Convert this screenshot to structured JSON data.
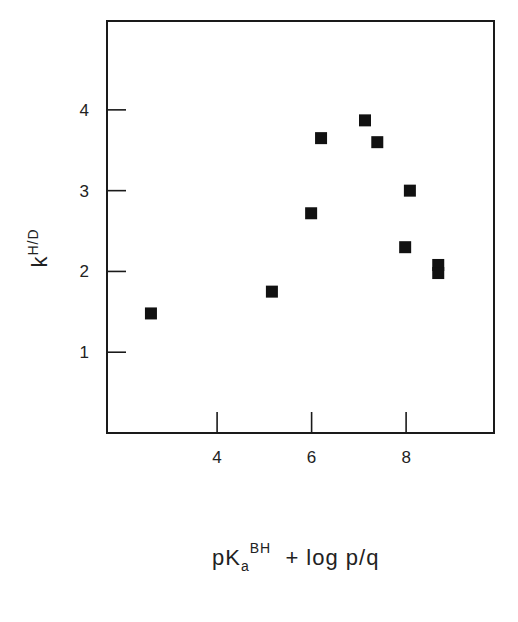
{
  "chart_data": {
    "type": "scatter",
    "title": "",
    "xlabel": {
      "main": "pK",
      "sub": "a",
      "sup": "BH",
      "rest": " + log p/q"
    },
    "ylabel": {
      "main": "k",
      "sup": "H/D"
    },
    "xlim": [
      1.67,
      9.86
    ],
    "ylim": [
      0.0,
      5.1
    ],
    "x_ticks": [
      4,
      6,
      8
    ],
    "x_tick_labels": [
      "4",
      "6",
      "8"
    ],
    "y_ticks": [
      1,
      2,
      3,
      4
    ],
    "y_tick_labels": [
      "1",
      "2",
      "3",
      "4"
    ],
    "grid": false,
    "legend": null,
    "marker": "square",
    "marker_color": "#111111",
    "series": [
      {
        "name": "data",
        "points": [
          {
            "x": 2.6,
            "y": 1.48
          },
          {
            "x": 5.16,
            "y": 1.75
          },
          {
            "x": 5.99,
            "y": 2.72
          },
          {
            "x": 6.2,
            "y": 3.65
          },
          {
            "x": 7.13,
            "y": 3.87
          },
          {
            "x": 7.39,
            "y": 3.6
          },
          {
            "x": 8.08,
            "y": 3.0
          },
          {
            "x": 7.98,
            "y": 2.3
          },
          {
            "x": 8.68,
            "y": 2.08
          },
          {
            "x": 8.68,
            "y": 1.98
          }
        ]
      }
    ]
  }
}
